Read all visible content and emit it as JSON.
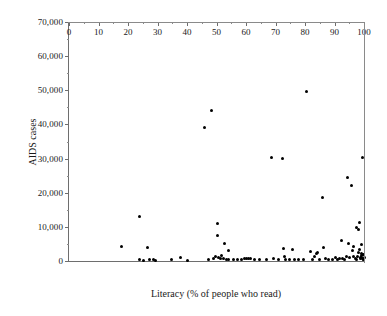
{
  "chart_data": {
    "type": "scatter",
    "title": "",
    "xlabel": "Literacy (% of people who read)",
    "ylabel": "AIDS cases",
    "xlim": [
      0,
      100
    ],
    "ylim": [
      0,
      70000
    ],
    "xticks": [
      0,
      10,
      20,
      30,
      40,
      50,
      60,
      70,
      80,
      90,
      100
    ],
    "xtick_labels": [
      "0",
      "10",
      "20",
      "30",
      "40",
      "50",
      "60",
      "70",
      "80",
      "90",
      "100"
    ],
    "xtick_minor_step": 5,
    "yticks": [
      0,
      10000,
      20000,
      30000,
      40000,
      50000,
      60000,
      70000
    ],
    "ytick_labels": [
      "0",
      "10,000",
      "20,000",
      "30,000",
      "40,000",
      "50,000",
      "60,000",
      "70,000"
    ],
    "ytick_minor_step": 5000,
    "grid": false,
    "legend": false,
    "marker": {
      "shape": "circle",
      "color": "#000000",
      "size_px": 3
    },
    "series": [
      {
        "name": "Countries",
        "points": [
          [
            17.8,
            4300
          ],
          [
            23.9,
            12900
          ],
          [
            24.0,
            300
          ],
          [
            25.4,
            250
          ],
          [
            26.6,
            3900
          ],
          [
            27.3,
            350
          ],
          [
            28.7,
            300
          ],
          [
            29.3,
            250
          ],
          [
            34.8,
            300
          ],
          [
            37.9,
            1000
          ],
          [
            40.0,
            250
          ],
          [
            45.8,
            39000
          ],
          [
            47.2,
            350
          ],
          [
            48.3,
            44000
          ],
          [
            49.0,
            600
          ],
          [
            49.6,
            1200
          ],
          [
            50.2,
            10900
          ],
          [
            50.4,
            7400
          ],
          [
            50.8,
            1000
          ],
          [
            51.2,
            800
          ],
          [
            51.8,
            1500
          ],
          [
            52.3,
            600
          ],
          [
            52.6,
            5000
          ],
          [
            53.4,
            400
          ],
          [
            53.9,
            3100
          ],
          [
            54.2,
            450
          ],
          [
            55.6,
            300
          ],
          [
            57.2,
            350
          ],
          [
            58.5,
            300
          ],
          [
            59.4,
            600
          ],
          [
            60.3,
            700
          ],
          [
            60.9,
            650
          ],
          [
            61.6,
            700
          ],
          [
            62.8,
            400
          ],
          [
            64.5,
            350
          ],
          [
            67.0,
            300
          ],
          [
            68.8,
            30400
          ],
          [
            69.4,
            700
          ],
          [
            71.0,
            300
          ],
          [
            72.4,
            29900
          ],
          [
            72.8,
            3700
          ],
          [
            73.0,
            1400
          ],
          [
            73.4,
            450
          ],
          [
            74.6,
            400
          ],
          [
            75.9,
            3500
          ],
          [
            76.4,
            350
          ],
          [
            77.8,
            350
          ],
          [
            79.4,
            400
          ],
          [
            80.6,
            49700
          ],
          [
            81.7,
            2700
          ],
          [
            82.4,
            350
          ],
          [
            83.2,
            1300
          ],
          [
            83.8,
            2100
          ],
          [
            84.3,
            2500
          ],
          [
            85.0,
            450
          ],
          [
            86.0,
            18500
          ],
          [
            86.4,
            3900
          ],
          [
            86.9,
            600
          ],
          [
            88.0,
            400
          ],
          [
            89.2,
            350
          ],
          [
            90.3,
            1100
          ],
          [
            91.0,
            400
          ],
          [
            91.6,
            600
          ],
          [
            92.4,
            5900
          ],
          [
            92.8,
            800
          ],
          [
            93.3,
            500
          ],
          [
            93.9,
            1200
          ],
          [
            94.5,
            24400
          ],
          [
            94.8,
            5200
          ],
          [
            95.2,
            900
          ],
          [
            95.6,
            22000
          ],
          [
            96.0,
            3000
          ],
          [
            96.3,
            1400
          ],
          [
            96.6,
            4200
          ],
          [
            97.0,
            700
          ],
          [
            97.3,
            9900
          ],
          [
            97.6,
            500
          ],
          [
            97.9,
            1300
          ],
          [
            98.1,
            9200
          ],
          [
            98.3,
            2600
          ],
          [
            98.5,
            11400
          ],
          [
            98.6,
            3500
          ],
          [
            98.8,
            1100
          ],
          [
            98.9,
            700
          ],
          [
            99.0,
            4800
          ],
          [
            99.1,
            2200
          ],
          [
            99.2,
            1500
          ],
          [
            99.3,
            900
          ],
          [
            99.4,
            30300
          ],
          [
            99.5,
            600
          ],
          [
            99.6,
            2000
          ],
          [
            99.7,
            400
          ],
          [
            99.8,
            1800
          ],
          [
            99.9,
            300
          ],
          [
            100.0,
            1000
          ]
        ]
      }
    ]
  }
}
